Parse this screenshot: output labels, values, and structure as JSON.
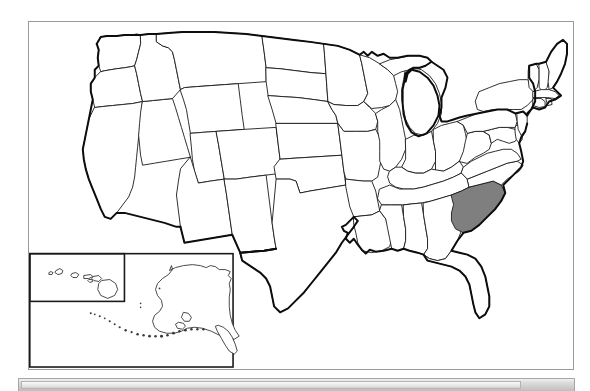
{
  "document": {
    "type": "image",
    "title": "Blank United States map with one state shaded"
  },
  "map": {
    "name": "united-states-outline-map",
    "projection_note": "contiguous US with Alaska and Hawaii insets",
    "highlighted_state": "South Carolina",
    "highlight_color": "#7f7f7f",
    "outline_color": "#0d0d0d",
    "state_border_color": "#1a1a1a",
    "background_color": "#ffffff",
    "frame_border_color": "#9a9a9a",
    "insets": [
      {
        "label": "Hawaii",
        "name": "hawaii-inset"
      },
      {
        "label": "Alaska",
        "name": "alaska-inset"
      }
    ],
    "states": [
      "Washington",
      "Oregon",
      "California",
      "Nevada",
      "Idaho",
      "Montana",
      "Wyoming",
      "Utah",
      "Arizona",
      "Colorado",
      "New Mexico",
      "North Dakota",
      "South Dakota",
      "Nebraska",
      "Kansas",
      "Oklahoma",
      "Texas",
      "Minnesota",
      "Iowa",
      "Missouri",
      "Arkansas",
      "Louisiana",
      "Wisconsin",
      "Illinois",
      "Michigan",
      "Indiana",
      "Ohio",
      "Kentucky",
      "Tennessee",
      "Mississippi",
      "Alabama",
      "Georgia",
      "Florida",
      "South Carolina",
      "North Carolina",
      "Virginia",
      "West Virginia",
      "Maryland",
      "Delaware",
      "Pennsylvania",
      "New Jersey",
      "New York",
      "Connecticut",
      "Rhode Island",
      "Massachusetts",
      "Vermont",
      "New Hampshire",
      "Maine",
      "Alaska",
      "Hawaii"
    ]
  },
  "bottom_bar": {
    "name": "horizontal-scrollbar",
    "track_color": "#dcdcdc",
    "thumb_color": "#e6e6e6"
  }
}
